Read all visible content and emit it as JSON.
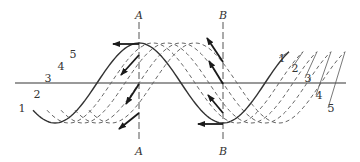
{
  "diagram": {
    "title": "",
    "axis": {
      "y": 83,
      "x_start": 15,
      "x_end": 346,
      "color": "#777777"
    },
    "wave": {
      "center_y": 83,
      "amplitude": 40,
      "wavelength": 168,
      "first_trough_x": 55,
      "shift_per_curve": 14,
      "x_start": 33,
      "x_span": 256
    },
    "curves": [
      {
        "id": "1",
        "style": "solid",
        "left_label": "1",
        "right_label": "1"
      },
      {
        "id": "2",
        "style": "dashed",
        "left_label": "2",
        "right_label": "2"
      },
      {
        "id": "3",
        "style": "dashed",
        "left_label": "3",
        "right_label": "3"
      },
      {
        "id": "4",
        "style": "dashed",
        "left_label": "4",
        "right_label": "4"
      },
      {
        "id": "5",
        "style": "dashed",
        "left_label": "5",
        "right_label": "5"
      }
    ],
    "left_labels": [
      {
        "text": "1",
        "x": 22,
        "y": 112
      },
      {
        "text": "2",
        "x": 37,
        "y": 98
      },
      {
        "text": "3",
        "x": 48,
        "y": 82
      },
      {
        "text": "4",
        "x": 61,
        "y": 70
      },
      {
        "text": "5",
        "x": 73,
        "y": 58
      }
    ],
    "right_labels": [
      {
        "text": "1",
        "x": 282,
        "y": 62
      },
      {
        "text": "2",
        "x": 295,
        "y": 72
      },
      {
        "text": "3",
        "x": 308,
        "y": 82
      },
      {
        "text": "4",
        "x": 319,
        "y": 99
      },
      {
        "text": "5",
        "x": 331,
        "y": 112
      }
    ],
    "section_lines": [
      {
        "name": "A",
        "x": 139,
        "top_label": "A",
        "bottom_label": "A"
      },
      {
        "name": "B",
        "x": 223,
        "top_label": "B",
        "bottom_label": "B"
      }
    ],
    "arrows_A": [
      {
        "x1": 139,
        "y1": 44,
        "x2": 113,
        "y2": 44
      },
      {
        "x1": 139,
        "y1": 55,
        "x2": 121,
        "y2": 75
      },
      {
        "x1": 139,
        "y1": 84,
        "x2": 126,
        "y2": 104
      },
      {
        "x1": 139,
        "y1": 113,
        "x2": 119,
        "y2": 129
      }
    ],
    "arrows_B": [
      {
        "x1": 223,
        "y1": 62,
        "x2": 207,
        "y2": 38
      },
      {
        "x1": 223,
        "y1": 84,
        "x2": 209,
        "y2": 61
      },
      {
        "x1": 223,
        "y1": 113,
        "x2": 208,
        "y2": 95
      },
      {
        "x1": 223,
        "y1": 124,
        "x2": 198,
        "y2": 124
      }
    ],
    "colors": {
      "curve": "#333333",
      "dashed_curve": "#666666",
      "section_line": "#555555",
      "arrow": "#1a1a1a"
    }
  }
}
